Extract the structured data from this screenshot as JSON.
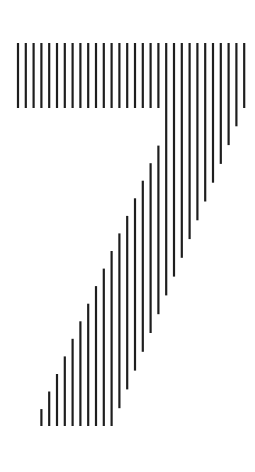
{
  "figure": {
    "glyph": "7",
    "style": "vertical-line-hatching",
    "line_color": "#1e1e1e",
    "background": "#ffffff",
    "line_count": 30
  }
}
